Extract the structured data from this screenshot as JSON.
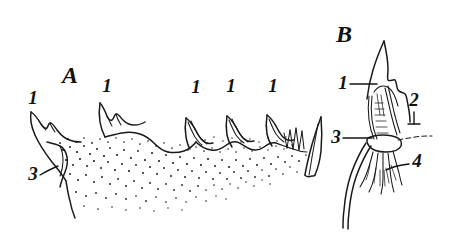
{
  "figure": {
    "kind": "scientific-line-drawing",
    "background_color": "#ffffff",
    "ink_color": "#1a1a1a",
    "width": 450,
    "height": 232,
    "panels": [
      {
        "id": "A",
        "letter": "A",
        "description": "Lateral view of a toothed margin with stippled shading and a row of cusps",
        "letter_position": {
          "x": 70,
          "y": 83
        },
        "callouts": [
          {
            "label": "1",
            "x": 33,
            "y": 104,
            "target": "cusp-left"
          },
          {
            "label": "1",
            "x": 107,
            "y": 92,
            "target": "cusp-second"
          },
          {
            "label": "1",
            "x": 196,
            "y": 93,
            "target": "cusp-middle"
          },
          {
            "label": "1",
            "x": 231,
            "y": 92,
            "target": "cusp-fourth"
          },
          {
            "label": "1",
            "x": 273,
            "y": 92,
            "target": "cusp-fifth"
          },
          {
            "label": "3",
            "x": 33,
            "y": 180,
            "target": "basal-shaded-lobe"
          }
        ]
      },
      {
        "id": "B",
        "letter": "B",
        "description": "Enlarged detail of a single cusp with internal duct and basal filaments",
        "letter_position": {
          "x": 344,
          "y": 42
        },
        "callouts": [
          {
            "label": "1",
            "x": 343,
            "y": 89,
            "target": "cusp-apex"
          },
          {
            "label": "2",
            "x": 414,
            "y": 106,
            "target": "margin-line"
          },
          {
            "label": "3",
            "x": 336,
            "y": 143,
            "target": "basal-collar"
          },
          {
            "label": "4",
            "x": 417,
            "y": 167,
            "target": "basal-filaments"
          }
        ]
      }
    ],
    "legend_numbers": [
      "1",
      "2",
      "3",
      "4"
    ],
    "panel_letters": [
      "A",
      "B"
    ]
  }
}
